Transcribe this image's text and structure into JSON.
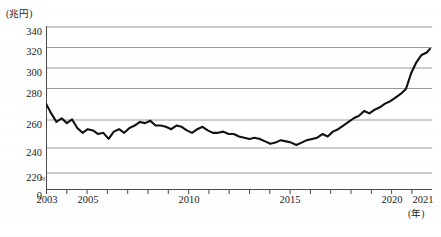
{
  "chart_data": {
    "type": "line",
    "title": "",
    "subtitle": "",
    "xlabel": "(年)",
    "ylabel": "(兆円)",
    "unit_y": "兆円",
    "unit_x": "年",
    "grid": true,
    "legend": "none",
    "axis_break": "≈",
    "ylim": [
      220,
      345
    ],
    "yticks": [
      340,
      320,
      300,
      280,
      260,
      240,
      220
    ],
    "ytick_labels": [
      "340",
      "320",
      "300",
      "280",
      "260",
      "240",
      "220",
      "0"
    ],
    "zero_label": "0",
    "xlim": [
      2003,
      2021.5
    ],
    "xticks": [
      2003,
      2004,
      2005,
      2006,
      2007,
      2008,
      2009,
      2010,
      2011,
      2012,
      2013,
      2014,
      2015,
      2016,
      2017,
      2018,
      2019,
      2020,
      2021
    ],
    "xtick_labels_shown": [
      "2003",
      "2005",
      "2010",
      "2015",
      "2020",
      "2021"
    ],
    "xtick_labels_shown_values": [
      2003,
      2005,
      2010,
      2015,
      2020,
      2021
    ],
    "series": [
      {
        "name": "series-1",
        "color": "#111111",
        "x": [
          2003.0,
          2003.25,
          2003.5,
          2003.75,
          2004.0,
          2004.25,
          2004.5,
          2004.75,
          2005.0,
          2005.25,
          2005.5,
          2005.75,
          2006.0,
          2006.25,
          2006.5,
          2006.75,
          2007.0,
          2007.25,
          2007.5,
          2007.75,
          2008.0,
          2008.25,
          2008.5,
          2008.75,
          2009.0,
          2009.25,
          2009.5,
          2009.75,
          2010.0,
          2010.25,
          2010.5,
          2010.75,
          2011.0,
          2011.25,
          2011.5,
          2011.75,
          2012.0,
          2012.25,
          2012.5,
          2012.75,
          2013.0,
          2013.25,
          2013.5,
          2013.75,
          2014.0,
          2014.25,
          2014.5,
          2014.75,
          2015.0,
          2015.25,
          2015.5,
          2015.75,
          2016.0,
          2016.25,
          2016.5,
          2016.75,
          2017.0,
          2017.25,
          2017.5,
          2017.75,
          2018.0,
          2018.25,
          2018.5,
          2018.75,
          2019.0,
          2019.25,
          2019.5,
          2019.75,
          2020.0,
          2020.25,
          2020.5,
          2020.75,
          2021.0,
          2021.25,
          2021.4
        ],
        "values": [
          277,
          269,
          262,
          265,
          261,
          264,
          257,
          253,
          256,
          255,
          252,
          253,
          248,
          254,
          256,
          253,
          257,
          259,
          262,
          261,
          263,
          259,
          259,
          258,
          256,
          259,
          258,
          255,
          253,
          256,
          258,
          255,
          253,
          253,
          254,
          252,
          252,
          250,
          249,
          248,
          249,
          248,
          246,
          244,
          245,
          247,
          246,
          245,
          243,
          245,
          247,
          248,
          249,
          252,
          250,
          254,
          256,
          259,
          262,
          265,
          267,
          271,
          269,
          272,
          274,
          277,
          279,
          282,
          285,
          289,
          302,
          311,
          317,
          319,
          322
        ]
      }
    ],
    "min_value": 243,
    "max_value": 322,
    "start_value": 277,
    "end_value": 322
  }
}
